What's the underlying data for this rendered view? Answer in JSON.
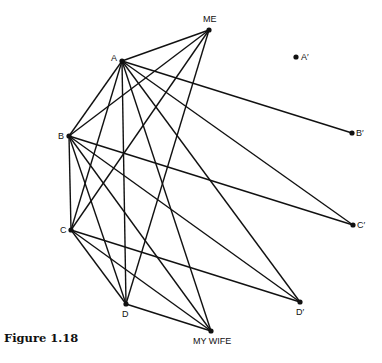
{
  "figure": {
    "caption": "Figure 1.18"
  },
  "graph": {
    "nodes": [
      {
        "id": "ME",
        "label": "ME",
        "x": 209,
        "y": 30,
        "lx": -6,
        "ly": -8
      },
      {
        "id": "A",
        "label": "A",
        "x": 122,
        "y": 61,
        "lx": -11,
        "ly": 0
      },
      {
        "id": "Ap",
        "label": "A′",
        "x": 296,
        "y": 57,
        "lx": 5,
        "ly": 3
      },
      {
        "id": "B",
        "label": "B",
        "x": 69,
        "y": 136,
        "lx": -11,
        "ly": 3
      },
      {
        "id": "Bp",
        "label": "B′",
        "x": 352,
        "y": 133,
        "lx": 4,
        "ly": 3
      },
      {
        "id": "C",
        "label": "C",
        "x": 71,
        "y": 230,
        "lx": -11,
        "ly": 3
      },
      {
        "id": "Cp",
        "label": "C′",
        "x": 353,
        "y": 225,
        "lx": 4,
        "ly": 3
      },
      {
        "id": "D",
        "label": "D",
        "x": 126,
        "y": 304,
        "lx": -4,
        "ly": 13
      },
      {
        "id": "Dp",
        "label": "D′",
        "x": 300,
        "y": 302,
        "lx": -4,
        "ly": 13
      },
      {
        "id": "MW",
        "label": "MY WIFE",
        "x": 211,
        "y": 331,
        "lx": -18,
        "ly": 13
      }
    ],
    "edges": [
      [
        "ME",
        "A"
      ],
      [
        "ME",
        "B"
      ],
      [
        "ME",
        "C"
      ],
      [
        "ME",
        "D"
      ],
      [
        "A",
        "Bp"
      ],
      [
        "A",
        "B"
      ],
      [
        "A",
        "C"
      ],
      [
        "A",
        "D"
      ],
      [
        "A",
        "MW"
      ],
      [
        "A",
        "Dp"
      ],
      [
        "A",
        "Cp"
      ],
      [
        "B",
        "C"
      ],
      [
        "B",
        "D"
      ],
      [
        "B",
        "MW"
      ],
      [
        "B",
        "Dp"
      ],
      [
        "B",
        "Cp"
      ],
      [
        "C",
        "D"
      ],
      [
        "C",
        "MW"
      ],
      [
        "C",
        "Dp"
      ],
      [
        "D",
        "MW"
      ]
    ]
  }
}
